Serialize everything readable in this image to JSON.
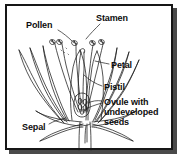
{
  "figure": {
    "kind": "botanical-diagram",
    "frame": {
      "border_color": "#161616",
      "shadow_color": "#4a4a4a",
      "background_color": "#ffffff"
    },
    "ink_color": "#1a1a1a",
    "text_color": "#0d0d0d"
  },
  "labels": {
    "pollen": "Pollen",
    "stamen": "Stamen",
    "petal": "Petal",
    "pistil": "Pistil",
    "ovule": "Ovule with\nundeveloped\nseeds",
    "sepal": "Sepal"
  }
}
